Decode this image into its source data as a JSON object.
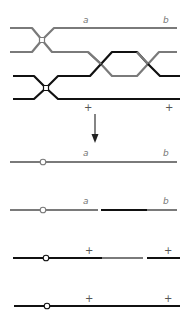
{
  "colors": {
    "gray_strand": "#7a7a7a",
    "black_strand": "#111111",
    "label": "#777777",
    "background": "#ffffff"
  },
  "top_panel": {
    "gray_label_1": "a",
    "gray_label_2": "b",
    "black_label_1": "+",
    "black_label_2": "+"
  },
  "arrow": {
    "direction": "down"
  },
  "bottom_panel": {
    "rows": [
      {
        "label_1": "a",
        "label_2": "b",
        "composition": "all gray"
      },
      {
        "label_1": "a",
        "label_2": "b",
        "composition": "gray, gap, black, gray"
      },
      {
        "label_1": "+",
        "label_2": "+",
        "composition": "black, gray, gap, black"
      },
      {
        "label_1": "+",
        "label_2": "+",
        "composition": "all black"
      }
    ]
  }
}
